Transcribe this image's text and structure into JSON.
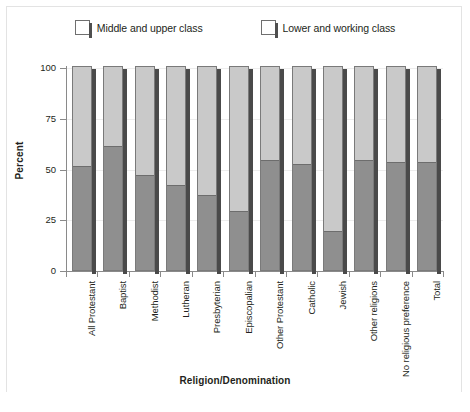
{
  "chart_data": {
    "type": "bar",
    "subtype": "stacked-100-percent",
    "title": "",
    "xlabel": "Religion/Denomination",
    "ylabel": "Percent",
    "ylim": [
      0,
      100
    ],
    "yticks": [
      0,
      25,
      50,
      75,
      100
    ],
    "grid": true,
    "legend_position": "top-center",
    "categories": [
      "All Protestant",
      "Baptist",
      "Methodist",
      "Lutheran",
      "Presbyterian",
      "Episcopalian",
      "Other Protestant",
      "Catholic",
      "Jewish",
      "Other religions",
      "No religious preference",
      "Total"
    ],
    "series": [
      {
        "name": "Middle and upper class",
        "color": "#c9c9c9",
        "values": [
          49,
          39,
          53,
          58,
          63,
          71,
          46,
          48,
          81,
          46,
          47,
          47
        ]
      },
      {
        "name": "Lower and working class",
        "color": "#8f8f8f",
        "values": [
          51,
          61,
          47,
          42,
          37,
          29,
          54,
          52,
          19,
          54,
          53,
          53
        ]
      }
    ]
  },
  "legend": {
    "items": [
      {
        "label": "Middle and upper class"
      },
      {
        "label": "Lower and working class"
      }
    ]
  },
  "axes": {
    "y_title": "Percent",
    "x_title": "Religion/Denomination",
    "y_tick_labels": [
      "100",
      "75",
      "50",
      "25",
      "0"
    ]
  }
}
